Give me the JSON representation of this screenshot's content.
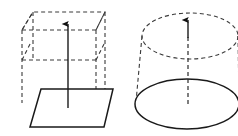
{
  "figure": {
    "width": 238,
    "height": 136,
    "background_color": "#ffffff",
    "solid_line_color": "#1a1a1a",
    "hidden_line_color": "#3a3a3a",
    "arrow_color": "#111111",
    "line_style_solid": "solid",
    "line_style_hidden": "dashed"
  },
  "shapes": [
    {
      "id": "prism",
      "name": "rectangular-prism",
      "label": "",
      "description": "Cube drawn in oblique projection with solid base parallelogram and dashed hidden edges",
      "base_face": {
        "style": "solid",
        "points": "30,127 104,127 113,89 41,89"
      },
      "top_face": {
        "style": "dashed",
        "points": "22,30 96,30 105,12 33,12"
      },
      "mid_face": {
        "style": "dashed",
        "points": "22,60 96,60"
      },
      "vertical_edges": [
        {
          "style": "dashed",
          "x1": 22,
          "y1": 30,
          "x2": 22,
          "y2": 100
        },
        {
          "style": "dashed",
          "x1": 96,
          "y1": 30,
          "x2": 96,
          "y2": 100
        },
        {
          "style": "dashed",
          "x1": 33,
          "y1": 12,
          "x2": 33,
          "y2": 60
        },
        {
          "style": "dashed",
          "x1": 105,
          "y1": 12,
          "x2": 105,
          "y2": 110
        }
      ],
      "axis": {
        "style": "solid",
        "x": 68,
        "y_top": 22,
        "y_bottom": 108,
        "arrow_direction": "up"
      }
    },
    {
      "id": "cylinder",
      "name": "cylinder",
      "label": "",
      "description": "Cylinder with dashed top ellipse, solid bottom ellipse and dashed sides",
      "top_ellipse": {
        "style": "dashed",
        "cx": 190,
        "cy": 36,
        "rx": 48,
        "ry": 23
      },
      "bottom_ellipse": {
        "style": "solid",
        "cx": 187,
        "cy": 104,
        "rx": 52,
        "ry": 25
      },
      "side_edges": [
        {
          "style": "dashed",
          "x1": 142,
          "y1": 36,
          "x2": 136,
          "y2": 104
        },
        {
          "style": "dashed",
          "x1": 238,
          "y1": 36,
          "x2": 239,
          "y2": 104
        }
      ],
      "axis": {
        "style": "dashed",
        "x": 188,
        "y_top": 18,
        "y_bottom": 104,
        "arrow_direction": "up"
      }
    }
  ],
  "annotations": {
    "arrow_count": 2,
    "arrow_meaning": "axis-of-symmetry",
    "visible_text": []
  }
}
